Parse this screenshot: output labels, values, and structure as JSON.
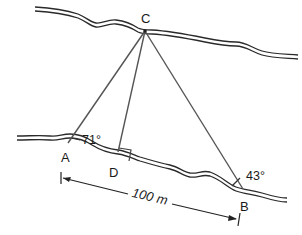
{
  "diagram": {
    "type": "geometry-river-width",
    "points": {
      "A": {
        "label": "A",
        "x": 68,
        "y": 145
      },
      "B": {
        "label": "B",
        "x": 243,
        "y": 191
      },
      "C": {
        "label": "C",
        "x": 145,
        "y": 31
      },
      "D": {
        "label": "D",
        "x": 118,
        "y": 158
      }
    },
    "angles": {
      "at_A": "71°",
      "at_B": "43°"
    },
    "right_angle_at": "D",
    "distance_AB": "100 m",
    "colors": {
      "line": "#555555",
      "bank": "#2a2a2a",
      "text": "#1a1a1a"
    }
  }
}
